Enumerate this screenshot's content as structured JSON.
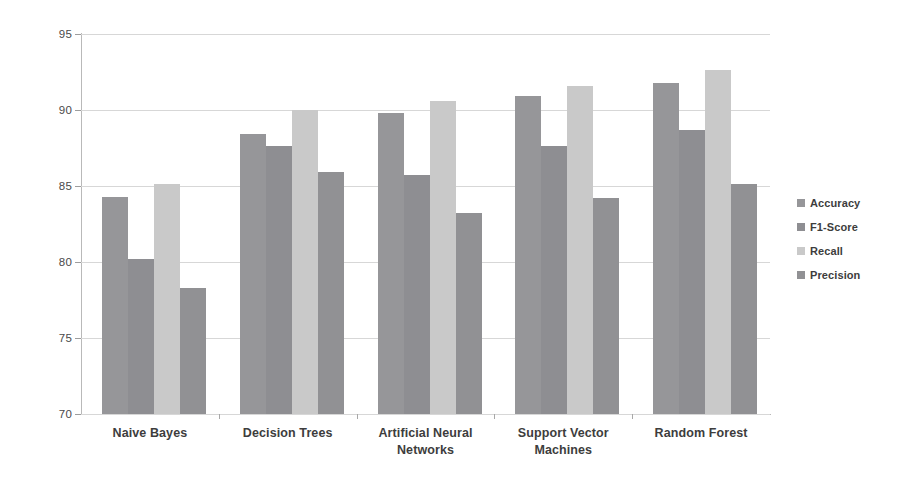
{
  "chart_data": {
    "type": "bar",
    "title": "",
    "subtitle": "",
    "xlabel": "",
    "ylabel": "",
    "ylim": [
      70,
      95
    ],
    "ytick_labels": [
      "95",
      "90",
      "85",
      "80",
      "75",
      "70"
    ],
    "ytick_values": [
      95,
      90,
      85,
      80,
      75,
      70
    ],
    "grid": true,
    "legend_position": "right",
    "categories": [
      "Naive Bayes",
      "Decision Trees",
      "Artificial Neural Networks",
      "Support Vector Machines",
      "Random Forest"
    ],
    "series": [
      {
        "name": "Accuracy",
        "color": "#969699",
        "values": [
          84.3,
          88.4,
          89.8,
          90.9,
          91.8
        ]
      },
      {
        "name": "F1-Score",
        "color": "#8e8e92",
        "values": [
          80.2,
          87.6,
          85.7,
          87.6,
          88.7
        ]
      },
      {
        "name": "Recall",
        "color": "#c9c9c9",
        "values": [
          85.1,
          90.0,
          90.6,
          91.6,
          92.6
        ]
      },
      {
        "name": "Precision",
        "color": "#919194",
        "values": [
          78.3,
          85.9,
          83.2,
          84.2,
          85.1
        ]
      }
    ]
  },
  "legend": {
    "items": [
      {
        "label": "Accuracy",
        "marker": "legend-swatch-accuracy"
      },
      {
        "label": "F1-Score",
        "marker": "legend-swatch-f1-score"
      },
      {
        "label": "Recall",
        "marker": "legend-swatch-recall"
      },
      {
        "label": "Precision",
        "marker": "legend-swatch-precision"
      }
    ]
  }
}
